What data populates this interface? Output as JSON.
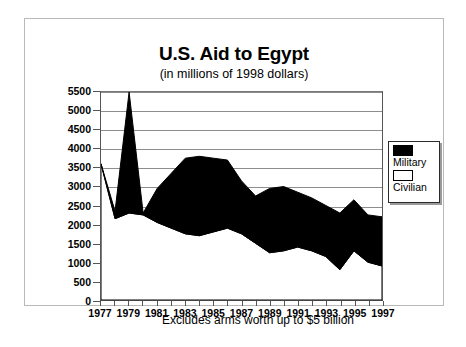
{
  "chart_data": {
    "type": "area",
    "title": "U.S. Aid to Egypt",
    "subtitle": "(in millions of 1998 dollars)",
    "footnote": "Excludes arms worth up to $5 billion",
    "stacked": true,
    "xlabel": "",
    "ylabel": "",
    "ylim": [
      0,
      5500
    ],
    "ytick_step": 500,
    "grid": true,
    "legend_position": "right",
    "x": [
      1977,
      1978,
      1979,
      1980,
      1981,
      1982,
      1983,
      1984,
      1985,
      1986,
      1987,
      1988,
      1989,
      1990,
      1991,
      1992,
      1993,
      1994,
      1995,
      1996,
      1997
    ],
    "xtick_labels": [
      "1977",
      "1979",
      "1981",
      "1983",
      "1985",
      "1987",
      "1989",
      "1991",
      "1993",
      "1995",
      "1997"
    ],
    "ytick_labels": [
      "0",
      "500",
      "1000",
      "1500",
      "2000",
      "2500",
      "3000",
      "3500",
      "4000",
      "4500",
      "5000",
      "5500"
    ],
    "series": [
      {
        "name": "Civilian",
        "color": "#ffffff",
        "values": [
          3600,
          2150,
          2300,
          2250,
          2050,
          1900,
          1750,
          1700,
          1800,
          1900,
          1750,
          1500,
          1250,
          1300,
          1400,
          1300,
          1150,
          800,
          1300,
          1000,
          900
        ]
      },
      {
        "name": "Military",
        "color": "#000000",
        "values": [
          0,
          200,
          3200,
          50,
          900,
          1450,
          2000,
          2100,
          1950,
          1800,
          1400,
          1250,
          1700,
          1700,
          1450,
          1400,
          1350,
          1500,
          1350,
          1250,
          1300
        ]
      }
    ],
    "totals": [
      3600,
      2350,
      5500,
      2300,
      2950,
      3350,
      3750,
      3800,
      3750,
      3700,
      3150,
      2750,
      2950,
      3000,
      2850,
      2700,
      2500,
      2300,
      2650,
      2250,
      2200
    ]
  },
  "legend": {
    "items": [
      {
        "label": "Military",
        "swatch": "black"
      },
      {
        "label": "Civilian",
        "swatch": "white"
      }
    ]
  },
  "page_bleed": {
    "text": ""
  }
}
